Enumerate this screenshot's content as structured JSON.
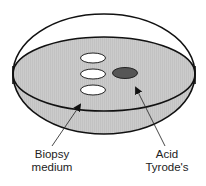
{
  "diagram": {
    "colors": {
      "medium_fill": "#c9c9c9",
      "outline": "#111111",
      "droplet_fill": "#ffffff",
      "acid_fill": "#565656",
      "arrow": "#333333"
    },
    "dish": {
      "cx": 104,
      "cy": 74,
      "rx": 91,
      "ry": 60
    },
    "medium_surface": {
      "cx": 104,
      "cy": 74,
      "rx": 91,
      "ry": 37
    },
    "droplets": [
      {
        "name": "biopsy-droplet-1",
        "cx": 93,
        "cy": 58,
        "rx": 12.5,
        "ry": 5
      },
      {
        "name": "biopsy-droplet-2",
        "cx": 93,
        "cy": 74,
        "rx": 12.5,
        "ry": 5
      },
      {
        "name": "biopsy-droplet-3",
        "cx": 93,
        "cy": 90,
        "rx": 12.5,
        "ry": 5
      }
    ],
    "acid_droplet": {
      "cx": 125,
      "cy": 73,
      "rx": 12.5,
      "ry": 5.5
    },
    "labels": {
      "biopsy": {
        "line1": "Biopsy",
        "line2": "medium"
      },
      "acid": {
        "line1": "Acid",
        "line2": "Tyrode's"
      }
    },
    "arrows": [
      {
        "name": "biopsy-arrow",
        "from": [
          52,
          146
        ],
        "to": [
          81,
          104
        ]
      },
      {
        "name": "acid-arrow",
        "from": [
          165,
          146
        ],
        "to": [
          135,
          87
        ]
      }
    ]
  }
}
